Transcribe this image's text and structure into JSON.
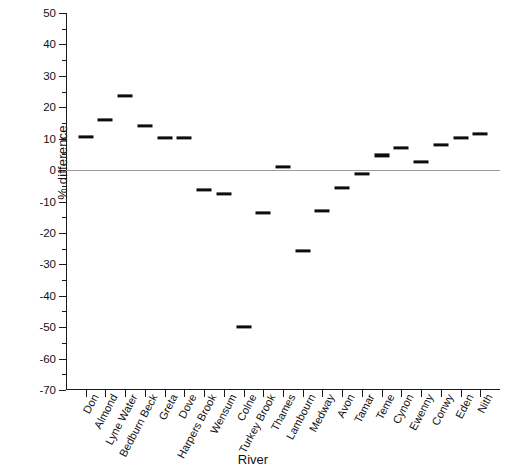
{
  "chart_data": {
    "type": "scatter",
    "title": "",
    "xlabel": "River",
    "ylabel": "% difference",
    "ylim": [
      -70,
      50
    ],
    "ytick_step": 10,
    "minor_tick_step": 5,
    "grid": false,
    "legend": false,
    "zero_reference_line": true,
    "marker_style": "horizontal dash",
    "marker_color": "#0d0d0d",
    "zero_line_color": "#9a9a9a",
    "axis_color": "#1a1a1a",
    "categories": [
      "Don",
      "Almond",
      "Lyne Water",
      "Bedburn Beck",
      "Greta",
      "Dove",
      "Harpers Brook",
      "Wensum",
      "Colne",
      "Turkey Brook",
      "Thames",
      "Lambourn",
      "Medway",
      "Avon",
      "Tamar",
      "Teme",
      "Cynon",
      "Ewenny",
      "Conwy",
      "Eden",
      "Nith"
    ],
    "values": [
      10.5,
      16,
      23.5,
      14,
      10.3,
      10.3,
      -6.3,
      -7.7,
      -50,
      -13.7,
      1,
      -25.7,
      -13,
      -5.7,
      -1.3,
      4.7,
      7,
      2.7,
      8,
      10.3,
      11.5
    ],
    "ytick_labels": [
      "50",
      "40",
      "30",
      "20",
      "10",
      "0",
      "-10",
      "-20",
      "-30",
      "-40",
      "-50",
      "-60",
      "-70"
    ]
  }
}
